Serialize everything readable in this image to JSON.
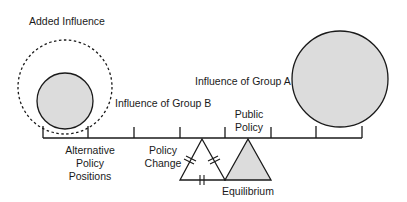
{
  "diagram": {
    "labels": {
      "added_influence": "Added Influence",
      "influence_group_a": "Influence of Group A",
      "influence_group_b": "Influence of Group B",
      "public_policy_line1": "Public",
      "public_policy_line2": "Policy",
      "policy_change_line1": "Policy",
      "policy_change_line2": "Change",
      "alternative_line1": "Alternative",
      "alternative_line2": "Policy",
      "alternative_line3": "Positions",
      "equilibrium": "Equilibrium"
    },
    "colors": {
      "stroke": "#1a1a1a",
      "fill_gray": "#dcdcdc",
      "background": "#ffffff"
    }
  }
}
